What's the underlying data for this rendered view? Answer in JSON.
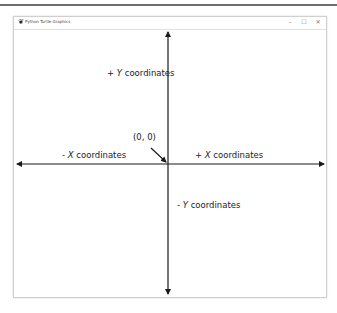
{
  "window": {
    "title": "Python Turtle Graphics",
    "controls": {
      "minimize": "–",
      "maximize": "☐",
      "close": "✕"
    }
  },
  "labels": {
    "pos_y": {
      "sign": "+",
      "axis": "Y",
      "text": "coordinates"
    },
    "neg_y": {
      "sign": "-",
      "axis": "Y",
      "text": "coordinates"
    },
    "pos_x": {
      "sign": "+",
      "axis": "X",
      "text": "coordinates"
    },
    "neg_x": {
      "sign": "-",
      "axis": "X",
      "text": "coordinates"
    },
    "origin": "(0, 0)"
  },
  "colors": {
    "axis": "#1a1a1a",
    "text": "#222222"
  }
}
